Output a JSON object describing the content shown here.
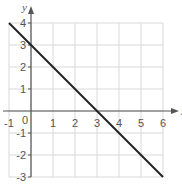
{
  "chart_data": {
    "type": "line",
    "title": "",
    "xlabel": "x",
    "ylabel": "y",
    "xlim": [
      -1,
      6
    ],
    "ylim": [
      -3,
      4
    ],
    "grid": true,
    "x_ticks": [
      -1,
      0,
      1,
      2,
      3,
      4,
      5,
      6
    ],
    "y_ticks": [
      -3,
      -2,
      -1,
      1,
      2,
      3,
      4
    ],
    "origin_label": "0",
    "series": [
      {
        "name": "y = -x + 3",
        "x": [
          -1,
          6
        ],
        "y": [
          4,
          -3
        ]
      }
    ],
    "colors": {
      "line": "#222222",
      "axis": "#555555",
      "grid": "#d9d9d9",
      "text": "#555555"
    }
  }
}
